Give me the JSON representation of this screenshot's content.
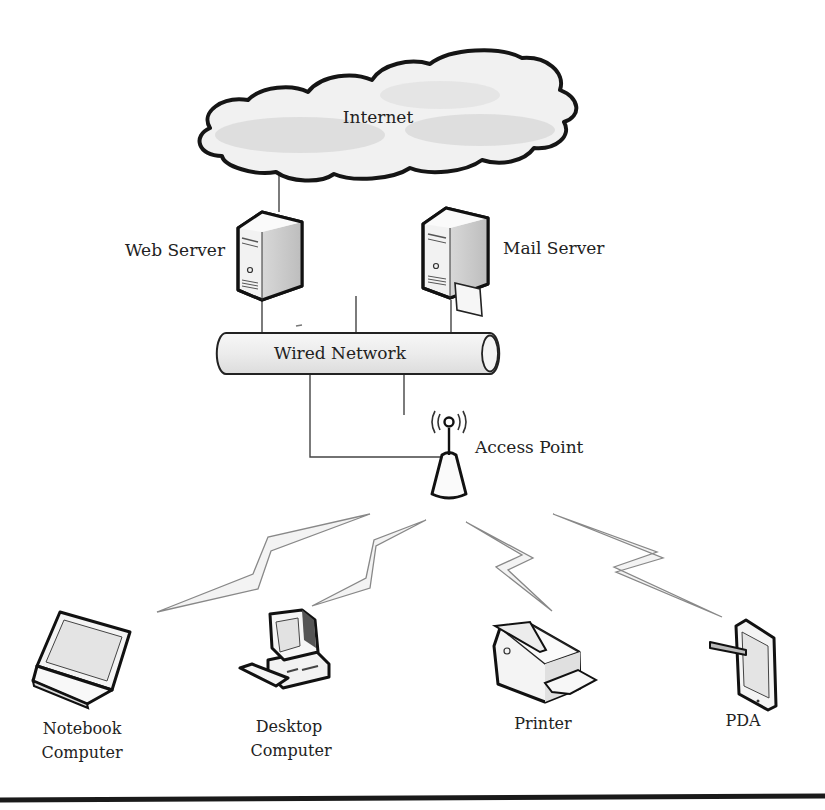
{
  "diagram": {
    "nodes": {
      "internet": {
        "label": "Internet",
        "icon": "cloud-icon"
      },
      "web_server": {
        "label": "Web Server",
        "icon": "server-tower-icon"
      },
      "mail_server": {
        "label": "Mail Server",
        "icon": "mail-server-icon"
      },
      "wired_network": {
        "label": "Wired Network",
        "icon": "pipe-icon"
      },
      "access_point": {
        "label": "Access Point",
        "icon": "wireless-antenna-icon"
      },
      "notebook": {
        "label_line1": "Notebook",
        "label_line2": "Computer",
        "icon": "laptop-icon"
      },
      "desktop": {
        "label_line1": "Desktop",
        "label_line2": "Computer",
        "icon": "desktop-computer-icon"
      },
      "printer": {
        "label": "Printer",
        "icon": "printer-icon"
      },
      "pda": {
        "label": "PDA",
        "icon": "tablet-stylus-icon"
      }
    },
    "edges": [
      {
        "from": "internet",
        "to": "web_server",
        "type": "wired"
      },
      {
        "from": "web_server",
        "to": "wired_network",
        "type": "wired"
      },
      {
        "from": "mail_server",
        "to": "wired_network",
        "type": "wired"
      },
      {
        "from": "wired_network",
        "to": "access_point",
        "type": "wired"
      },
      {
        "from": "access_point",
        "to": "notebook",
        "type": "wireless"
      },
      {
        "from": "access_point",
        "to": "desktop",
        "type": "wireless"
      },
      {
        "from": "access_point",
        "to": "printer",
        "type": "wireless"
      },
      {
        "from": "access_point",
        "to": "pda",
        "type": "wireless"
      }
    ]
  }
}
